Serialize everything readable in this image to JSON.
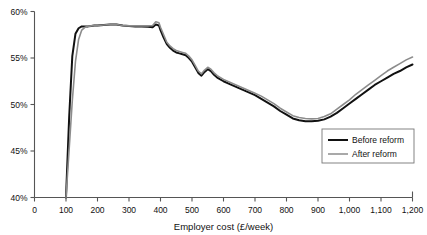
{
  "chart_data": {
    "type": "line",
    "title": "",
    "subtitle": "",
    "xlabel": "Employer cost (£/week)",
    "ylabel": "",
    "xlim": [
      0,
      1200
    ],
    "ylim": [
      40,
      60
    ],
    "grid": false,
    "legend_position": "lower-right-inside",
    "xticks": [
      0,
      100,
      200,
      300,
      400,
      500,
      600,
      700,
      800,
      900,
      1000,
      1100,
      1200
    ],
    "xticklabels": [
      "0",
      "100",
      "200",
      "300",
      "400",
      "500",
      "600",
      "700",
      "800",
      "900",
      "1,000",
      "1,100",
      "1,200"
    ],
    "yticks": [
      40,
      45,
      50,
      55,
      60
    ],
    "yticklabels": [
      "40%",
      "45%",
      "50%",
      "55%",
      "60%"
    ],
    "series": [
      {
        "name": "Before reform",
        "color": "#111111",
        "width": 2.0,
        "x": [
          100,
          110,
          120,
          130,
          140,
          150,
          160,
          170,
          180,
          190,
          200,
          220,
          240,
          260,
          280,
          300,
          320,
          340,
          360,
          375,
          385,
          395,
          400,
          410,
          420,
          430,
          440,
          450,
          460,
          470,
          480,
          490,
          500,
          510,
          520,
          530,
          540,
          550,
          560,
          570,
          580,
          600,
          620,
          640,
          660,
          680,
          700,
          720,
          740,
          760,
          780,
          800,
          820,
          840,
          860,
          880,
          900,
          920,
          940,
          960,
          980,
          1000,
          1020,
          1040,
          1060,
          1080,
          1100,
          1120,
          1140,
          1160,
          1180,
          1200
        ],
        "y": [
          40.0,
          48.6,
          55.2,
          57.6,
          58.2,
          58.4,
          58.4,
          58.4,
          58.45,
          58.5,
          58.5,
          58.55,
          58.6,
          58.6,
          58.5,
          58.45,
          58.4,
          58.4,
          58.35,
          58.3,
          58.6,
          58.5,
          58.0,
          57.2,
          56.5,
          56.1,
          55.8,
          55.6,
          55.5,
          55.4,
          55.3,
          55.0,
          54.6,
          54.0,
          53.4,
          53.1,
          53.5,
          53.8,
          53.6,
          53.2,
          52.9,
          52.5,
          52.2,
          51.9,
          51.6,
          51.3,
          51.0,
          50.6,
          50.2,
          49.8,
          49.3,
          48.9,
          48.5,
          48.3,
          48.2,
          48.2,
          48.25,
          48.4,
          48.7,
          49.1,
          49.6,
          50.1,
          50.6,
          51.1,
          51.6,
          52.1,
          52.5,
          52.9,
          53.3,
          53.6,
          54.0,
          54.3
        ]
      },
      {
        "name": "After reform",
        "color": "#8c8c8c",
        "width": 1.6,
        "x": [
          100,
          110,
          120,
          130,
          140,
          150,
          160,
          170,
          180,
          190,
          200,
          220,
          240,
          260,
          280,
          300,
          320,
          340,
          360,
          375,
          385,
          395,
          400,
          410,
          420,
          430,
          440,
          450,
          460,
          470,
          480,
          490,
          500,
          510,
          520,
          530,
          540,
          550,
          560,
          570,
          580,
          600,
          620,
          640,
          660,
          680,
          700,
          720,
          740,
          760,
          780,
          800,
          820,
          840,
          860,
          880,
          900,
          920,
          940,
          960,
          980,
          1000,
          1020,
          1040,
          1060,
          1080,
          1100,
          1120,
          1140,
          1160,
          1180,
          1200
        ],
        "y": [
          40.0,
          45.2,
          50.4,
          54.6,
          57.0,
          58.0,
          58.3,
          58.4,
          58.45,
          58.5,
          58.5,
          58.55,
          58.6,
          58.6,
          58.5,
          58.45,
          58.45,
          58.45,
          58.45,
          58.5,
          58.9,
          58.8,
          58.3,
          57.5,
          56.7,
          56.3,
          56.0,
          55.8,
          55.7,
          55.6,
          55.5,
          55.2,
          54.8,
          54.2,
          53.6,
          53.3,
          53.7,
          54.0,
          53.8,
          53.4,
          53.1,
          52.7,
          52.4,
          52.1,
          51.8,
          51.5,
          51.2,
          50.9,
          50.5,
          50.1,
          49.6,
          49.2,
          48.8,
          48.6,
          48.5,
          48.45,
          48.5,
          48.7,
          49.0,
          49.5,
          50.0,
          50.5,
          51.1,
          51.6,
          52.1,
          52.6,
          53.1,
          53.6,
          54.0,
          54.4,
          54.8,
          55.1
        ]
      }
    ]
  },
  "legend": {
    "items": [
      {
        "label": "Before reform",
        "color": "#111111"
      },
      {
        "label": "After reform",
        "color": "#8c8c8c"
      }
    ]
  }
}
